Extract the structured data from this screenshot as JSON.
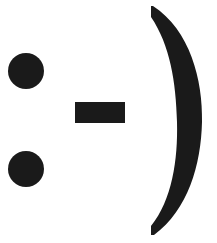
{
  "emoticon": {
    "text": ":-)",
    "meaning": "smiley face",
    "color": "#1a1a1a",
    "background": "#ffffff"
  }
}
